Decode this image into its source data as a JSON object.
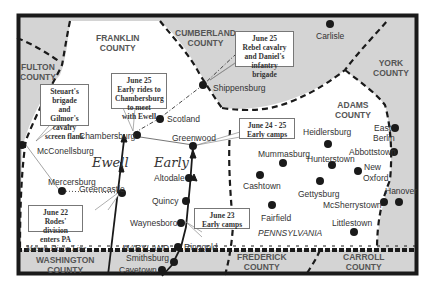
{
  "map": {
    "colors": {
      "frame": "#1a1a1a",
      "outside_county": "#d4d4d4",
      "inside": "#ffffff",
      "text": "#333333"
    },
    "counties": [
      {
        "name": "FRANKLIN COUNTY",
        "line1": "FRANKLIN",
        "line2": "COUNTY"
      },
      {
        "name": "CUMBERLAND COUNTY",
        "line1": "CUMBERLAND",
        "line2": "COUNTY"
      },
      {
        "name": "FULTON COUNTY",
        "line1": "FULTON",
        "line2": "COUNTY"
      },
      {
        "name": "YORK COUNTY",
        "line1": "YORK",
        "line2": "COUNTY"
      },
      {
        "name": "ADAMS COUNTY",
        "line1": "ADAMS",
        "line2": "COUNTY"
      },
      {
        "name": "WASHINGTON COUNTY",
        "line1": "WASHINGTON",
        "line2": "COUNTY"
      },
      {
        "name": "FREDERICK COUNTY",
        "line1": "FREDERICK",
        "line2": "COUNTY"
      },
      {
        "name": "CARROLL COUNTY",
        "line1": "CARROLL",
        "line2": "COUNTY"
      }
    ],
    "towns": [
      "Carlisle",
      "Shippensburg",
      "Scotland",
      "Chambersburg",
      "Greenwood",
      "McConellsburg",
      "Mercersburg",
      "Greencastle",
      "Altodale",
      "Quincy",
      "Waynesboro",
      "Ringgold",
      "Smithsburg",
      "Cavetown",
      "Heidlersburg",
      "East",
      "Berlin",
      "Abbottstown",
      "Mummasburg",
      "Hunterstown",
      "New",
      "Oxford",
      "Cashtown",
      "Gettysburg",
      "McSherrystown",
      "Hanover",
      "Fairfield",
      "Littlestown"
    ],
    "commanders": {
      "ewell": "Ewell",
      "early": "Early"
    },
    "states": {
      "pa": "PENNSYLVANIA",
      "md": "MARYLAND"
    },
    "mason_dixon": "Mason-Dixon Line",
    "callouts": [
      {
        "lines": [
          "June 25",
          "Early rides to",
          "Chambersburg",
          "to meet",
          "with Ewell"
        ]
      },
      {
        "lines": [
          "June 25",
          "Rebel cavalry",
          "and Daniel's",
          "infantry brigade"
        ]
      },
      {
        "lines": [
          "Steuart's",
          "brigade",
          "and Gilmor's",
          "cavalry",
          "screen flank"
        ]
      },
      {
        "lines": [
          "June 24 - 25",
          "Early camps"
        ]
      },
      {
        "lines": [
          "June 22",
          "Rodes' division",
          "enters PA"
        ]
      },
      {
        "lines": [
          "June 23",
          "Early camps"
        ]
      }
    ]
  }
}
